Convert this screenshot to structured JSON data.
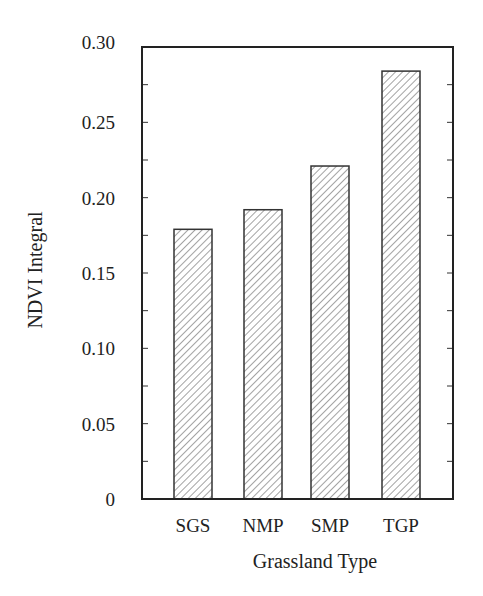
{
  "chart_data": {
    "type": "bar",
    "title": "",
    "xlabel": "Grassland Type",
    "ylabel": "NDVI Integral",
    "categories": [
      "SGS",
      "NMP",
      "SMP",
      "TGP"
    ],
    "values": [
      0.179,
      0.192,
      0.221,
      0.284
    ],
    "ylim": [
      0,
      0.3
    ],
    "yticks": [
      "0",
      "0.05",
      "0.10",
      "0.15",
      "0.20",
      "0.25",
      "0.30"
    ],
    "minor_tick_step": 0.025,
    "grid": false,
    "legend": null,
    "bar_fill": "diagonal hatch",
    "colors": {
      "axis": "#222222",
      "hatch": "#444444",
      "background": "#ffffff"
    }
  }
}
